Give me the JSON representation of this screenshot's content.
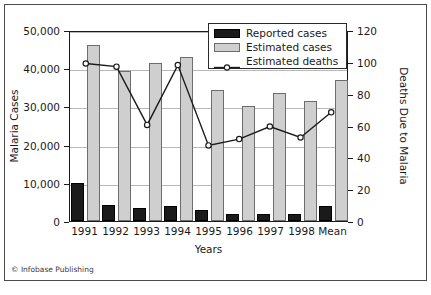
{
  "figure": {
    "credit": "© Infobase Publishing"
  },
  "chart_data": {
    "type": "bar",
    "title": "",
    "xlabel": "Years",
    "ylabel": "Malaria Cases",
    "y2label": "Deaths Due to Malaria",
    "categories": [
      "1991",
      "1992",
      "1993",
      "1994",
      "1995",
      "1996",
      "1997",
      "1998",
      "Mean"
    ],
    "ylim": [
      0,
      50000
    ],
    "y2lim": [
      0,
      120
    ],
    "yticks": [
      "0",
      "10,000",
      "20,000",
      "30,000",
      "40,000",
      "50,000"
    ],
    "ytick_values": [
      0,
      10000,
      20000,
      30000,
      40000,
      50000
    ],
    "y2ticks": [
      "0",
      "20",
      "40",
      "60",
      "80",
      "100",
      "120"
    ],
    "y2tick_values": [
      0,
      20,
      40,
      60,
      80,
      100,
      120
    ],
    "grid": true,
    "legend_position": "top-right",
    "series": [
      {
        "name": "Reported cases",
        "type": "bar",
        "axis": "left",
        "color": "#1a1a1a",
        "values": [
          10000,
          4200,
          3400,
          3900,
          2800,
          1800,
          1800,
          1800,
          3900
        ]
      },
      {
        "name": "Estimated cases",
        "type": "bar",
        "axis": "left",
        "color": "#cfcfcf",
        "values": [
          46000,
          39300,
          41400,
          43000,
          34300,
          30000,
          33600,
          31300,
          37000
        ]
      },
      {
        "name": "Estimated deaths",
        "type": "line",
        "axis": "right",
        "color": "#1a1a1a",
        "marker": "open-circle",
        "values": [
          100,
          98,
          61,
          99,
          48,
          52,
          60,
          53,
          69
        ]
      }
    ]
  },
  "legend": {
    "items": [
      {
        "label": "Reported cases",
        "swatch": "black-bar"
      },
      {
        "label": "Estimated cases",
        "swatch": "gray-bar"
      },
      {
        "label": "Estimated deaths",
        "swatch": "line-marker"
      }
    ]
  }
}
